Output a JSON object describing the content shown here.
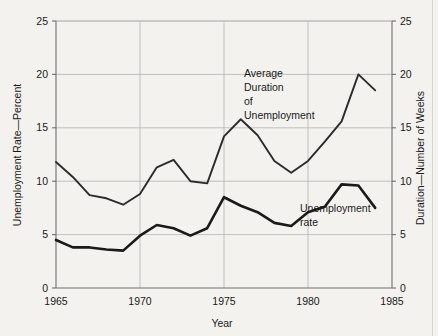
{
  "chart_data": {
    "type": "line",
    "title": "",
    "subtitle": "",
    "xlabel": "Year",
    "ylabel": "Unemployment Rate—Percent",
    "y2label": "Duration—Number of Weeks",
    "x": [
      1965,
      1966,
      1967,
      1968,
      1969,
      1970,
      1971,
      1972,
      1973,
      1974,
      1975,
      1976,
      1977,
      1978,
      1979,
      1980,
      1981,
      1982,
      1983,
      1984
    ],
    "xlim": [
      1965,
      1985
    ],
    "ylim": [
      0,
      25
    ],
    "y2lim": [
      0,
      25
    ],
    "xticks": [
      1965,
      1970,
      1975,
      1980,
      1985
    ],
    "xtick_labels": [
      "1965",
      "1970",
      "1975",
      "1980",
      "1985"
    ],
    "yticks": [
      0,
      5,
      10,
      15,
      20,
      25
    ],
    "ytick_labels": [
      "0",
      "5",
      "10",
      "15",
      "20",
      "25"
    ],
    "y2ticks": [
      0,
      5,
      10,
      15,
      20,
      25
    ],
    "y2tick_labels": [
      "0",
      "5",
      "10",
      "15",
      "20",
      "25"
    ],
    "grid": true,
    "legend_position": "inline-annotations",
    "series": [
      {
        "name": "Unemployment rate",
        "axis": "left",
        "units": "percent",
        "color": "#1a1a1a",
        "line_width": 2.6,
        "values": [
          4.5,
          3.8,
          3.8,
          3.6,
          3.5,
          4.9,
          5.9,
          5.6,
          4.9,
          5.6,
          8.5,
          7.7,
          7.1,
          6.1,
          5.8,
          7.1,
          7.6,
          9.7,
          9.6,
          7.5
        ]
      },
      {
        "name": "Average Duration of Unemployment",
        "axis": "right",
        "units": "weeks",
        "color": "#2b2b2b",
        "line_width": 1.9,
        "values": [
          11.8,
          10.4,
          8.7,
          8.4,
          7.8,
          8.8,
          11.3,
          12.0,
          10.0,
          9.8,
          14.2,
          15.8,
          14.3,
          11.9,
          10.8,
          11.9,
          13.7,
          15.6,
          20.0,
          18.5
        ]
      }
    ],
    "annotations": [
      {
        "name": "duration-annotation",
        "lines": [
          "Average",
          "Duration",
          "of",
          "Unemployment"
        ],
        "x": 244,
        "y": 77
      },
      {
        "name": "rate-annotation",
        "lines": [
          "Unemployment",
          "rate"
        ],
        "x": 300,
        "y": 212
      }
    ]
  },
  "colors": {
    "background": "#f4f2ee",
    "axis": "#6e6e6e",
    "grid": "#b4b4b4",
    "text": "#1a1a1a",
    "series_rate": "#1a1a1a",
    "series_duration": "#2b2b2b"
  }
}
